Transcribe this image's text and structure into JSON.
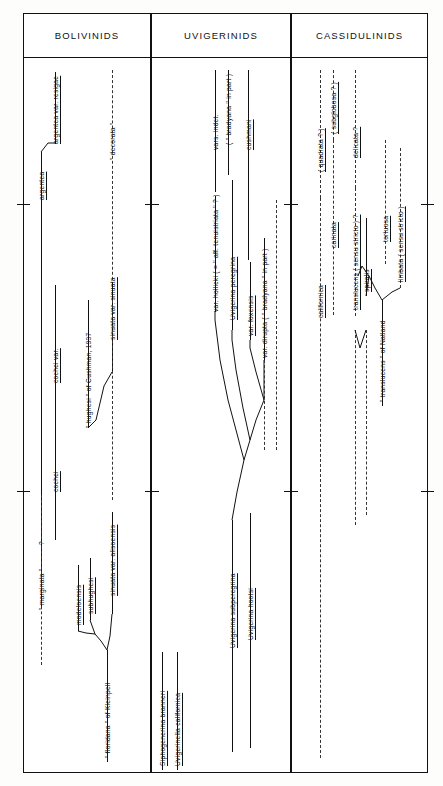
{
  "figure": {
    "type": "stratigraphic-range-chart",
    "orientation": "vertical-ranges-rotated-labels",
    "columns": [
      {
        "id": "bolivinids",
        "header": "BOLIVINIDS"
      },
      {
        "id": "uvigerinids",
        "header": "UVIGERINIDS"
      },
      {
        "id": "cassidulinids",
        "header": "CASSIDULINIDS"
      }
    ]
  },
  "bolivinids": {
    "header": "BOLIVINIDS",
    "taxa": [
      {
        "label": "argentea",
        "style": "solid"
      },
      {
        "label": "argentea  var.  resigae",
        "style": "solid"
      },
      {
        "label": "\" decorata \"",
        "style": "dashed"
      },
      {
        "label": "cochei  var.",
        "style": "solid"
      },
      {
        "label": "cochei",
        "style": "solid"
      },
      {
        "label": "\" hughesi \"  of  Cushman,  1937",
        "style": "solid"
      },
      {
        "label": "sinuata  var.  sinuata",
        "style": "solid"
      },
      {
        "label": "?",
        "style": "dashed"
      },
      {
        "label": "\" marginata \"",
        "style": "dashed"
      },
      {
        "label": "modeloensis",
        "style": "solid"
      },
      {
        "label": "subhughesi",
        "style": "solid"
      },
      {
        "label": "sinuata  var.  alisoensis",
        "style": "solid"
      },
      {
        "label": "\" floridana \"  of  Kleinpell",
        "style": "solid"
      }
    ]
  },
  "uvigerinids": {
    "header": "UVIGERINIDS",
    "taxa": [
      {
        "label": "vars.  indet.",
        "style": "solid"
      },
      {
        "label": "( \" bradyana \"  in  part )",
        "style": "solid"
      },
      {
        "label": "cushmani",
        "style": "solid"
      },
      {
        "label": "var.  hollicki  ( = \" aff.  tenuistriata \" ? )",
        "style": "solid"
      },
      {
        "label": "Uvigerina  peregrina",
        "style": "solid"
      },
      {
        "label": "var.  foxensis",
        "style": "solid"
      },
      {
        "label": "var.  dirupta ( \" bradyana \"  in  part )",
        "style": "solid"
      },
      {
        "label": "Uvigerina  subperegrina",
        "style": "solid"
      },
      {
        "label": "Uvigerina  hootsi",
        "style": "solid"
      },
      {
        "label": "Siphogenerina  branneri",
        "style": "solid"
      },
      {
        "label": "Uvigerinella  californica",
        "style": "solid"
      }
    ]
  },
  "cassidulinids": {
    "header": "CASSIDULINIDS",
    "taxa": [
      {
        "label": "( quadrata  ? )",
        "style": "solid"
      },
      {
        "label": "( subglobosa  ? )",
        "style": "solid"
      },
      {
        "label": "delicata  ?",
        "style": "solid"
      },
      {
        "label": "carinata",
        "style": "solid"
      },
      {
        "label": "translucens  ( sensu  stricto )  ?",
        "style": "solid"
      },
      {
        "label": "spiralis",
        "style": "solid"
      },
      {
        "label": "tortuosa",
        "style": "solid"
      },
      {
        "label": "limbata  ( sensu  stricto )",
        "style": "solid"
      },
      {
        "label": "\" translucens \"   of   Natland",
        "style": "solid"
      },
      {
        "label": "californica",
        "style": "solid"
      }
    ]
  },
  "colors": {
    "ink": "#111111",
    "paper": "#ffffff",
    "dash": "#333333"
  }
}
